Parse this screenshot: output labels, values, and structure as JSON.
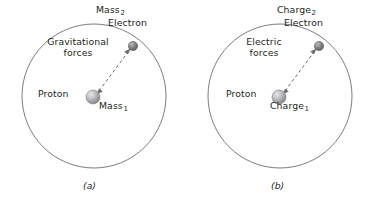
{
  "figure": {
    "background_color": "#ffffff",
    "line_color": "#58595b",
    "text_color": "#231f20",
    "proton_color": "#a7a9ac",
    "electron_color": "#808285"
  },
  "panels": [
    {
      "caption": "(a)",
      "orbit_label_top": "Mass",
      "orbit_label_top_sub": "2",
      "electron_label": "Electron",
      "force_line1": "Gravitational",
      "force_line2": "forces",
      "proton_label": "Proton",
      "center_label": "Mass",
      "center_label_sub": "1"
    },
    {
      "caption": "(b)",
      "orbit_label_top": "Charge",
      "orbit_label_top_sub": "2",
      "electron_label": "Electron",
      "force_line1": "Electric",
      "force_line2": "forces",
      "proton_label": "Proton",
      "center_label": "Charge",
      "center_label_sub": "1"
    }
  ],
  "geometry": {
    "orbit_center_x": 94,
    "orbit_center_y": 96,
    "orbit_radius": 72,
    "proton_x": 93,
    "proton_y": 97,
    "proton_radius": 7,
    "electron_x": 133,
    "electron_y": 46,
    "electron_radius": 4.5
  }
}
